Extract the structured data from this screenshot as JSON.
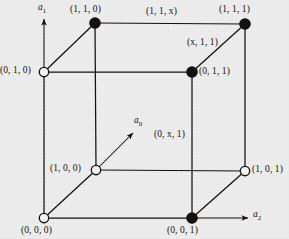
{
  "figure": {
    "background_color": "#ededed",
    "ink_color": "#14110f"
  },
  "axes": [
    {
      "id": "a0",
      "label": "a",
      "subscript": "0",
      "direction": "diagonal-up-right",
      "x": 134,
      "y": 117
    },
    {
      "id": "a1",
      "label": "a",
      "subscript": "1",
      "direction": "up",
      "x": 38,
      "y": 4
    },
    {
      "id": "a2",
      "label": "a",
      "subscript": "2",
      "direction": "right",
      "x": 252,
      "y": 210
    }
  ],
  "vertices": [
    {
      "id": "v110",
      "label": "(1, 1, 0)",
      "fill": "solid",
      "cx": 95,
      "cy": 23,
      "lx": 70,
      "ly": 6,
      "anchor": "above"
    },
    {
      "id": "v111",
      "label": "(1, 1, 1)",
      "fill": "solid",
      "cx": 245,
      "cy": 24,
      "lx": 220,
      "ly": 6,
      "anchor": "above"
    },
    {
      "id": "v010",
      "label": "(0, 1, 0)",
      "fill": "open",
      "cx": 44,
      "cy": 72,
      "lx": 0,
      "ly": 66,
      "anchor": "left"
    },
    {
      "id": "v011",
      "label": "(0, 1, 1)",
      "fill": "solid",
      "cx": 192,
      "cy": 72,
      "lx": 199,
      "ly": 66,
      "anchor": "right"
    },
    {
      "id": "v100",
      "label": "(1, 0, 0)",
      "fill": "open",
      "cx": 96,
      "cy": 170,
      "lx": 51,
      "ly": 164,
      "anchor": "left"
    },
    {
      "id": "v101",
      "label": "(1, 0, 1)",
      "fill": "open",
      "cx": 245,
      "cy": 171,
      "lx": 252,
      "ly": 165,
      "anchor": "right"
    },
    {
      "id": "v000",
      "label": "(0, 0, 0)",
      "fill": "open",
      "cx": 44,
      "cy": 218,
      "lx": 22,
      "ly": 226,
      "anchor": "below"
    },
    {
      "id": "v001",
      "label": "(0, 0, 1)",
      "fill": "solid",
      "cx": 192,
      "cy": 218,
      "lx": 168,
      "ly": 226,
      "anchor": "below"
    }
  ],
  "edge_labels": [
    {
      "id": "e11x",
      "label": "(1, 1, x)",
      "x": 146,
      "y": 8,
      "edge": "v110-v111"
    },
    {
      "id": "ex11",
      "label": "(x, 1, 1)",
      "x": 187,
      "y": 38,
      "edge": "v011-v111"
    },
    {
      "id": "e0x1",
      "label": "(0, x, 1)",
      "x": 154,
      "y": 130,
      "edge": "v001-v011"
    }
  ],
  "edges": [
    {
      "from": "v010",
      "to": "v110",
      "style": "solid"
    },
    {
      "from": "v110",
      "to": "v111",
      "style": "solid"
    },
    {
      "from": "v011",
      "to": "v111",
      "style": "solid"
    },
    {
      "from": "v010",
      "to": "v011",
      "style": "solid"
    },
    {
      "from": "v000",
      "to": "v100",
      "style": "solid"
    },
    {
      "from": "v100",
      "to": "v101",
      "style": "solid"
    },
    {
      "from": "v001",
      "to": "v101",
      "style": "solid"
    },
    {
      "from": "v000",
      "to": "v001",
      "style": "solid"
    },
    {
      "from": "v010",
      "to": "v000",
      "style": "solid"
    },
    {
      "from": "v110",
      "to": "v100",
      "style": "solid"
    },
    {
      "from": "v111",
      "to": "v101",
      "style": "solid"
    },
    {
      "from": "v011",
      "to": "v001",
      "style": "solid"
    }
  ]
}
